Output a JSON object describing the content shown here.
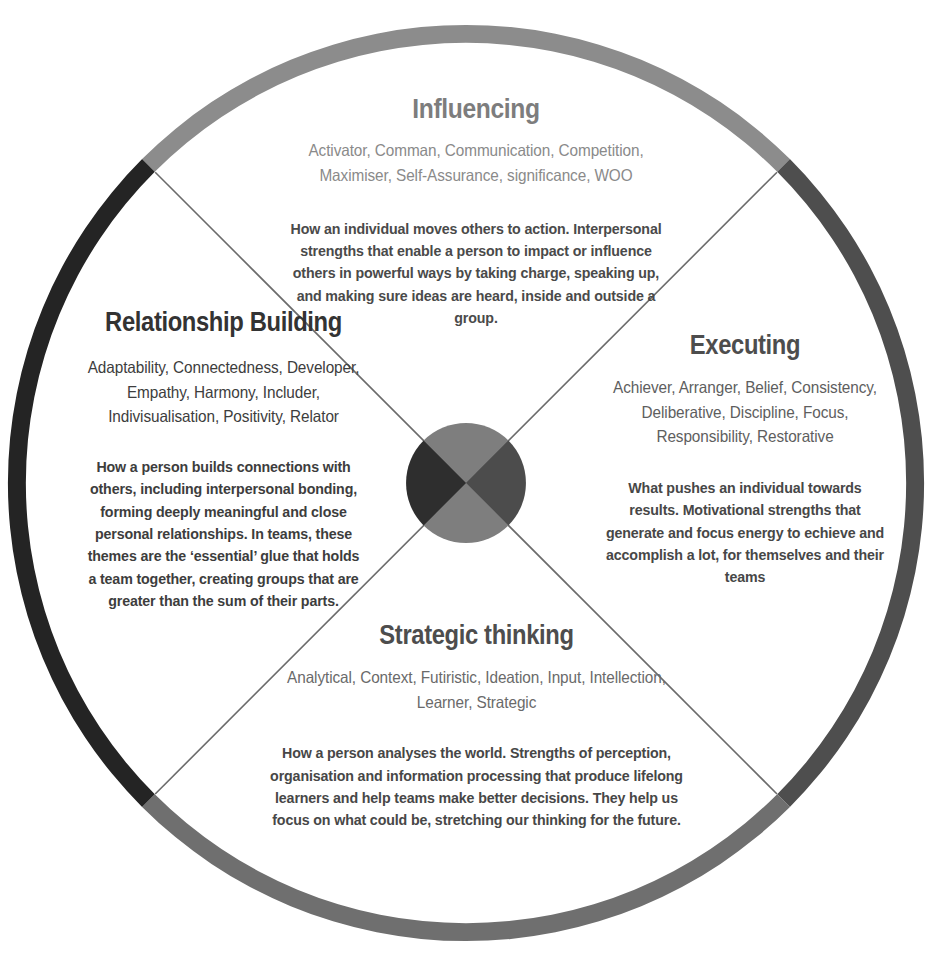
{
  "figure": {
    "name": "CliftonStrengths domain wheel",
    "background_color": "#ffffff",
    "ring": {
      "segments": [
        {
          "name": "influencing-arc",
          "color": "#8c8c8c"
        },
        {
          "name": "executing-arc",
          "color": "#4e4e4e"
        },
        {
          "name": "strategic-thinking-arc",
          "color": "#6f6f6f"
        },
        {
          "name": "relationship-building-arc",
          "color": "#242424"
        }
      ]
    },
    "hub": {
      "name": "center-hub",
      "segments": [
        {
          "name": "hub-influencing",
          "color": "#7e7e7e"
        },
        {
          "name": "hub-executing",
          "color": "#4c4c4c"
        },
        {
          "name": "hub-strategic",
          "color": "#7e7e7e"
        },
        {
          "name": "hub-relationship",
          "color": "#2e2e2e"
        }
      ]
    },
    "divider_line_color": "#6b6b6b"
  },
  "quadrants": {
    "influencing": {
      "title": "Influencing",
      "title_color": "#7d7d7d",
      "themes": "Activator, Comman, Communication, Competition, Maximiser, Self-Assurance, significance, WOO",
      "themes_color": "#8a8a8a",
      "description": "How an individual moves others to action. Interpersonal strengths that enable a person to impact or influence others in powerful ways by taking charge, speaking up, and making sure ideas are heard, inside and outside a group.",
      "description_color": "#4a4a4a"
    },
    "relationship_building": {
      "title": "Relationship Building",
      "title_color": "#333333",
      "themes": "Adaptability, Connectedness, Developer, Empathy, Harmony, Includer, Indivisualisation, Positivity, Relator",
      "themes_color": "#3d3d3d",
      "description": "How a person builds connections with others, including interpersonal bonding, forming deeply meaningful and close personal relationships. In teams, these themes are the ‘essential’ glue that holds a team together, creating groups that are greater than the sum of their parts.",
      "description_color": "#3d3d3d"
    },
    "executing": {
      "title": "Executing",
      "title_color": "#4d4d4d",
      "themes": "Achiever, Arranger, Belief, Consistency, Deliberative, Discipline, Focus, Responsibility, Restorative",
      "themes_color": "#5e5e5e",
      "description": "What pushes an individual towards results. Motivational strengths that generate and focus energy to echieve and accomplish a lot, for themselves and their teams",
      "description_color": "#474747"
    },
    "strategic_thinking": {
      "title": "Strategic thinking",
      "title_color": "#4d4d4d",
      "themes": "Analytical, Context, Futiristic, Ideation, Input, Intellection, Learner, Strategic",
      "themes_color": "#6a6a6a",
      "description": "How a person analyses the world. Strengths of perception, organisation and information processing that produce lifelong learners and help teams make better decisions. They help us focus on what could be, stretching our thinking for the future.",
      "description_color": "#474747"
    }
  }
}
